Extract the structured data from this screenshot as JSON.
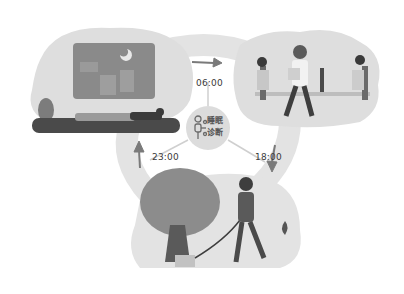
{
  "diagram": {
    "type": "daily-cycle",
    "center": {
      "icon": "sleep-tracker-icon",
      "line1": "睡眠",
      "line2": "诊断"
    },
    "times": {
      "morning": "06:00",
      "evening": "18:00",
      "night": "23:00"
    },
    "scenes": [
      {
        "name": "sleep",
        "desc": "person sleeping under night window with moon"
      },
      {
        "name": "work",
        "desc": "office workers at desks"
      },
      {
        "name": "walk",
        "desc": "man walking dog near tree"
      }
    ],
    "colors": {
      "bg": "#ffffff",
      "blob": "#e6e6e6",
      "dark": "#4a4a4a",
      "mid": "#8c8c8c",
      "text": "#3a3a3a"
    }
  }
}
